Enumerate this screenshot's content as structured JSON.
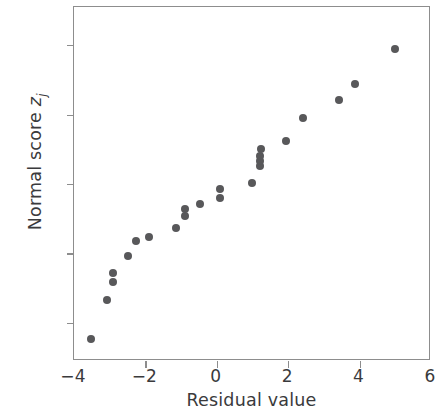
{
  "chart_data": {
    "type": "scatter",
    "title": "",
    "xlabel": "Residual value",
    "ylabel": "Normal score z_j",
    "ylabel_main": "Normal score ",
    "ylabel_symbol": "z",
    "ylabel_subscript": "j",
    "xlim": [
      -4,
      6
    ],
    "ylim": [
      -2.55,
      2.55
    ],
    "xticks": [
      -4,
      -2,
      0,
      2,
      4,
      6
    ],
    "yticks": [
      -2,
      -1,
      0,
      1,
      2
    ],
    "xticklabels": [
      "−4",
      "−2",
      "0",
      "2",
      "4",
      "6"
    ],
    "yticklabels": [
      "−2",
      "−1",
      "0",
      "1",
      "2"
    ],
    "grid": false,
    "legend": false,
    "marker_color": "#58585a",
    "axis_color": "#8d8d8d",
    "text_color": "#3a3a3c",
    "background": "#ffffff",
    "n_points": 23,
    "x": [
      -3.52,
      -3.08,
      -2.91,
      -2.91,
      -2.5,
      -2.25,
      -1.9,
      -1.15,
      -0.88,
      -0.88,
      -0.47,
      0.08,
      0.08,
      0.99,
      1.21,
      1.21,
      1.21,
      1.24,
      1.95,
      2.42,
      3.43,
      3.87,
      5.0
    ],
    "y": [
      -2.24,
      -1.67,
      -1.41,
      -1.28,
      -1.04,
      -0.82,
      -0.76,
      -0.63,
      -0.46,
      -0.36,
      -0.29,
      -0.2,
      -0.07,
      0.01,
      0.26,
      0.33,
      0.4,
      0.5,
      0.62,
      0.95,
      1.21,
      1.44,
      1.94
    ],
    "points": [
      {
        "x": -3.52,
        "y": -2.24
      },
      {
        "x": -3.08,
        "y": -1.67
      },
      {
        "x": -2.91,
        "y": -1.41
      },
      {
        "x": -2.91,
        "y": -1.28
      },
      {
        "x": -2.5,
        "y": -1.04
      },
      {
        "x": -2.25,
        "y": -0.82
      },
      {
        "x": -1.9,
        "y": -0.76
      },
      {
        "x": -1.15,
        "y": -0.63
      },
      {
        "x": -0.88,
        "y": -0.46
      },
      {
        "x": -0.88,
        "y": -0.36
      },
      {
        "x": -0.47,
        "y": -0.29
      },
      {
        "x": 0.08,
        "y": -0.2
      },
      {
        "x": 0.08,
        "y": -0.07
      },
      {
        "x": 0.99,
        "y": 0.01
      },
      {
        "x": 1.21,
        "y": 0.26
      },
      {
        "x": 1.21,
        "y": 0.33
      },
      {
        "x": 1.21,
        "y": 0.4
      },
      {
        "x": 1.24,
        "y": 0.5
      },
      {
        "x": 1.95,
        "y": 0.62
      },
      {
        "x": 2.42,
        "y": 0.95
      },
      {
        "x": 3.43,
        "y": 1.21
      },
      {
        "x": 3.87,
        "y": 1.44
      },
      {
        "x": 5.0,
        "y": 1.94
      }
    ]
  }
}
